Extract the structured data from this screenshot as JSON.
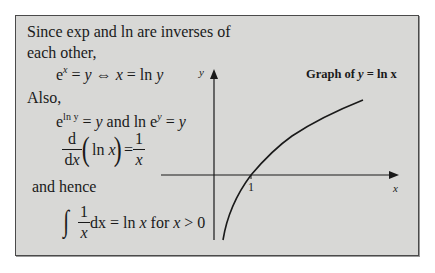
{
  "text": {
    "line1": "Since exp and ln are inverses of",
    "line2": "each other,",
    "eq1": {
      "e": "e",
      "sup": "x",
      "rest1": " = ",
      "y1": "y",
      "iff": " ⇔ ",
      "x": "x",
      "rest2": " = ln ",
      "y2": "y"
    },
    "also": "Also,",
    "eq2": {
      "e1": "e",
      "sup1": "ln y",
      "mid1": " = ",
      "y1": "y",
      "and": " and ln e",
      "sup2": "y",
      "mid2": " = ",
      "y2": "y"
    },
    "deriv": {
      "d": "d",
      "dx_d": "d",
      "dx_x": "x",
      "ln": "ln ",
      "x": "x",
      "eq": "=",
      "one": "1",
      "den": "x"
    },
    "hence": "and hence",
    "integral": {
      "sign": "∫",
      "one": "1",
      "den": "x",
      "dx": " dx = ln ",
      "x1": "x",
      "for": " for ",
      "x2": "x",
      "tail": " > 0"
    }
  },
  "graph": {
    "title_prefix": "Graph of ",
    "title_var": "y",
    "title_suffix": " = ln x",
    "x_axis_label": "x",
    "y_axis_label": "y",
    "tick_label": "1",
    "function": "y = ln x"
  }
}
